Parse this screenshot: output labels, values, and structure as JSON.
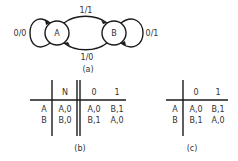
{
  "diagram_a": {
    "caption": "(a)",
    "states": [
      {
        "id": "A",
        "label": "A"
      },
      {
        "id": "B",
        "label": "B"
      }
    ],
    "transitions": [
      {
        "from": "A",
        "to": "A",
        "label": "0/0"
      },
      {
        "from": "A",
        "to": "B",
        "label": "1/1"
      },
      {
        "from": "B",
        "to": "A",
        "label": "1/0"
      },
      {
        "from": "B",
        "to": "B",
        "label": "0/1"
      }
    ]
  },
  "table_b": {
    "caption": "(b)",
    "headers": [
      "",
      "N",
      "0",
      "1"
    ],
    "rows": [
      {
        "state": "A",
        "n": "A,0",
        "c0": "A,0",
        "c1": "B,1"
      },
      {
        "state": "B",
        "n": "B,0",
        "c0": "B,1",
        "c1": "A,0"
      }
    ]
  },
  "table_c": {
    "caption": "(c)",
    "headers": [
      "",
      "0",
      "1"
    ],
    "rows": [
      {
        "state": "A",
        "c0": "A,0",
        "c1": "B,1"
      },
      {
        "state": "B",
        "c0": "B,1",
        "c1": "A,0"
      }
    ]
  },
  "colors": {
    "stroke": "#1a1a1a",
    "text": "#333333",
    "background": "#ffffff"
  }
}
